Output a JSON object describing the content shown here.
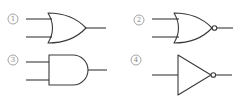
{
  "figure": {
    "type": "logic-gate-options",
    "stroke_color": "#3a3a3a",
    "label_color": "#8a8a8a",
    "background": "#ffffff"
  },
  "options": [
    {
      "number": "1",
      "label": "①",
      "gate": "OR",
      "inputs": 2,
      "inverted_output": false,
      "icon": "or-gate-icon"
    },
    {
      "number": "2",
      "label": "②",
      "gate": "NOR",
      "inputs": 2,
      "inverted_output": true,
      "icon": "nor-gate-icon"
    },
    {
      "number": "3",
      "label": "③",
      "gate": "AND",
      "inputs": 2,
      "inverted_output": false,
      "icon": "and-gate-icon"
    },
    {
      "number": "4",
      "label": "④",
      "gate": "NOT",
      "inputs": 1,
      "inverted_output": true,
      "icon": "not-gate-icon"
    }
  ]
}
